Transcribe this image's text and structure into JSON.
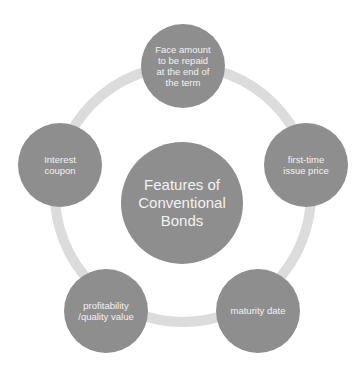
{
  "diagram": {
    "type": "radial-cycle",
    "colors": {
      "node_fill": "#8e8e8e",
      "ring": "#dcdcdc",
      "text": "#f2f2f2"
    },
    "center": {
      "label": "Features of\nConventional\nBonds"
    },
    "nodes": [
      {
        "id": "face-amount",
        "label": "Face amount\nto be repaid\nat the end of\nthe term"
      },
      {
        "id": "first-time-issue-price",
        "label": "first-time\nissue price"
      },
      {
        "id": "maturity-date",
        "label": "maturity date"
      },
      {
        "id": "profitability-quality-value",
        "label": "profitability\n/quality value"
      },
      {
        "id": "interest-coupon",
        "label": "Interest\ncoupon"
      }
    ]
  }
}
